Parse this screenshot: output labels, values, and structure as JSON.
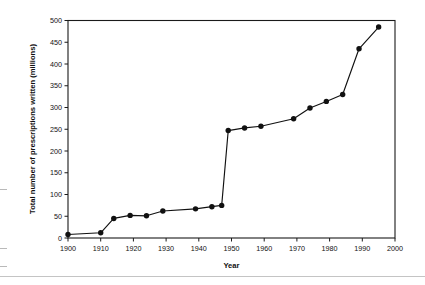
{
  "chart_data": {
    "type": "line",
    "title": "",
    "xlabel": "Year",
    "ylabel": "Total number of prescriptions written (millions)",
    "xlim": [
      1900,
      2000
    ],
    "ylim": [
      0,
      500
    ],
    "xticks": [
      1900,
      1910,
      1920,
      1930,
      1940,
      1950,
      1960,
      1970,
      1980,
      1990,
      2000
    ],
    "yticks": [
      0,
      50,
      100,
      150,
      200,
      250,
      300,
      350,
      400,
      450,
      500
    ],
    "grid": false,
    "legend": "none",
    "marker": "filled-circle",
    "line_color": "#111111",
    "marker_color": "#111111",
    "x": [
      1900,
      1910,
      1914,
      1919,
      1924,
      1929,
      1939,
      1944,
      1947,
      1949,
      1954,
      1959,
      1969,
      1974,
      1979,
      1984,
      1989,
      1995
    ],
    "values": [
      8,
      12,
      45,
      52,
      51,
      62,
      67,
      72,
      75,
      247,
      253,
      257,
      274,
      299,
      314,
      330,
      435,
      485
    ],
    "series": [
      {
        "name": "Total prescriptions written",
        "x": [
          1900,
          1910,
          1914,
          1919,
          1924,
          1929,
          1939,
          1944,
          1947,
          1949,
          1954,
          1959,
          1969,
          1974,
          1979,
          1984,
          1989,
          1995
        ],
        "values": [
          8,
          12,
          45,
          52,
          51,
          62,
          67,
          72,
          75,
          247,
          253,
          257,
          274,
          299,
          314,
          330,
          435,
          485
        ]
      }
    ],
    "annotations": []
  }
}
